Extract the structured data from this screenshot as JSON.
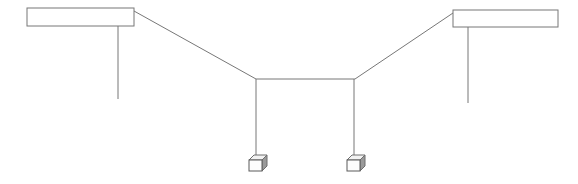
{
  "figure": {
    "canvas": {
      "width": 578,
      "height": 184,
      "background": "#ffffff"
    },
    "stroke": {
      "color": "#777777",
      "dark_color": "#5a5a5a",
      "width": 1
    }
  },
  "chart_data": {
    "type": "line",
    "xlabel": "",
    "ylabel": "",
    "xlim": [
      0,
      578
    ],
    "ylim": [
      184,
      0
    ],
    "grid": false,
    "legend": "none",
    "series": [
      {
        "name": "left-support-beam",
        "kind": "rectangle",
        "x": 27,
        "y": 8,
        "width": 107,
        "height": 18,
        "points": [
          [
            27,
            8
          ],
          [
            134,
            8
          ],
          [
            134,
            26
          ],
          [
            27,
            26
          ],
          [
            27,
            8
          ]
        ]
      },
      {
        "name": "right-support-beam",
        "kind": "rectangle",
        "x": 453,
        "y": 10,
        "width": 105,
        "height": 17,
        "points": [
          [
            453,
            10
          ],
          [
            558,
            10
          ],
          [
            558,
            27
          ],
          [
            453,
            27
          ],
          [
            453,
            10
          ]
        ]
      },
      {
        "name": "left-hanger-line",
        "kind": "line",
        "points": [
          [
            118,
            26
          ],
          [
            118,
            99
          ]
        ]
      },
      {
        "name": "right-hanger-line",
        "kind": "line",
        "points": [
          [
            468,
            27
          ],
          [
            468,
            103
          ]
        ]
      },
      {
        "name": "left-diagonal-cable",
        "kind": "line",
        "points": [
          [
            134,
            11
          ],
          [
            256,
            79
          ]
        ]
      },
      {
        "name": "right-diagonal-cable",
        "kind": "line",
        "points": [
          [
            355,
            79
          ],
          [
            453,
            13
          ]
        ]
      },
      {
        "name": "center-span-line",
        "kind": "line",
        "points": [
          [
            256,
            79
          ],
          [
            355,
            79
          ]
        ]
      },
      {
        "name": "left-drop-line",
        "kind": "line",
        "points": [
          [
            256,
            79
          ],
          [
            256,
            155
          ]
        ]
      },
      {
        "name": "right-drop-line",
        "kind": "line",
        "points": [
          [
            354,
            79
          ],
          [
            354,
            155
          ]
        ]
      },
      {
        "name": "left-load-cube",
        "kind": "cube",
        "x": 249,
        "y": 155,
        "size": 13,
        "depth": 5
      },
      {
        "name": "right-load-cube",
        "kind": "cube",
        "x": 347,
        "y": 155,
        "size": 13,
        "depth": 5
      }
    ]
  }
}
